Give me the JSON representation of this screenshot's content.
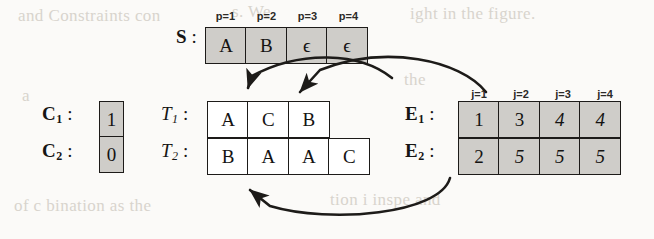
{
  "figure": {
    "background_color": "#fbfaf8",
    "ink_color": "#1d1b19",
    "shaded_cell_color": "#cfcdc9",
    "unshaded_cell_color": "#ffffff"
  },
  "stack": {
    "label_symbol": "S",
    "label_colon": ":",
    "index_labels": [
      "p=1",
      "p=2",
      "p=3",
      "p=4"
    ],
    "cells": [
      {
        "value": "A",
        "shaded": true
      },
      {
        "value": "B",
        "shaded": true
      },
      {
        "value": "ϵ",
        "shaded": true
      },
      {
        "value": "ϵ",
        "shaded": true
      }
    ]
  },
  "counters": [
    {
      "label_symbol": "C",
      "subscript": "1",
      "label_colon": ":",
      "value": "1",
      "shaded": true
    },
    {
      "label_symbol": "C",
      "subscript": "2",
      "label_colon": ":",
      "value": "0",
      "shaded": true
    }
  ],
  "tapes": [
    {
      "label_symbol": "T",
      "subscript": "1",
      "label_colon": ":",
      "cells": [
        {
          "value": "A",
          "shaded": false
        },
        {
          "value": "C",
          "shaded": false
        },
        {
          "value": "B",
          "shaded": false
        }
      ]
    },
    {
      "label_symbol": "T",
      "subscript": "2",
      "label_colon": ":",
      "cells": [
        {
          "value": "B",
          "shaded": false
        },
        {
          "value": "A",
          "shaded": false
        },
        {
          "value": "A",
          "shaded": false
        },
        {
          "value": "C",
          "shaded": false
        }
      ]
    }
  ],
  "encodings": {
    "index_labels": [
      "j=1",
      "j=2",
      "j=3",
      "j=4"
    ],
    "rows": [
      {
        "label_symbol": "E",
        "subscript": "1",
        "label_colon": ":",
        "cells": [
          {
            "value": "1",
            "shaded": true,
            "italic": false
          },
          {
            "value": "3",
            "shaded": true,
            "italic": false
          },
          {
            "value": "4",
            "shaded": true,
            "italic": true
          },
          {
            "value": "4",
            "shaded": true,
            "italic": true
          }
        ]
      },
      {
        "label_symbol": "E",
        "subscript": "2",
        "label_colon": ":",
        "cells": [
          {
            "value": "2",
            "shaded": true,
            "italic": false
          },
          {
            "value": "5",
            "shaded": true,
            "italic": true
          },
          {
            "value": "5",
            "shaded": true,
            "italic": true
          },
          {
            "value": "5",
            "shaded": true,
            "italic": true
          }
        ]
      }
    ]
  },
  "arrows": [
    {
      "name": "stack-to-tape1-arrow"
    },
    {
      "name": "encoding1-to-tape1-arrow"
    },
    {
      "name": "encoding2-to-tape2-arrow"
    }
  ],
  "background_ghost_text": {
    "line1": "and Constraints con",
    "line2": "s. We",
    "line3": "ight in the figure.",
    "line4": "a",
    "line5": "tion i inspe and",
    "line6": "of c bination as the",
    "line7": "the",
    "line8": "d"
  }
}
